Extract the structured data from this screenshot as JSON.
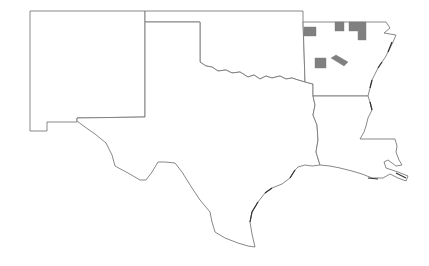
{
  "map": {
    "region": "South Central United States",
    "states": [
      {
        "id": "NM",
        "name": "New Mexico"
      },
      {
        "id": "TX",
        "name": "Texas"
      },
      {
        "id": "OK",
        "name": "Oklahoma"
      },
      {
        "id": "AR",
        "name": "Arkansas"
      },
      {
        "id": "LA",
        "name": "Louisiana"
      }
    ],
    "highlighted_counties": {
      "state": "Arkansas",
      "count": 6,
      "color": "#808080"
    },
    "background": "#ffffff",
    "border_color": "#7a7a7a"
  }
}
